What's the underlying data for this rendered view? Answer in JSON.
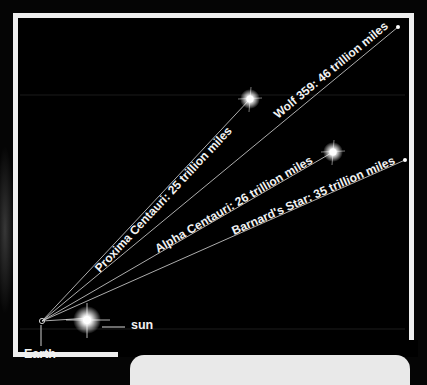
{
  "diagram": {
    "origin_label": "Earth",
    "sun_label": "sun",
    "stars": [
      {
        "name": "Proxima Centauri",
        "distance": "25 trillion miles",
        "label": "Proxima Centauri: 25 trillion miles",
        "type": "bright"
      },
      {
        "name": "Wolf 359",
        "distance": "46 trillion miles",
        "label": "Wolf 359: 46 trillion miles",
        "type": "dot"
      },
      {
        "name": "Alpha Centauri",
        "distance": "26 trillion miles",
        "label": "Alpha Centauri: 26 trillion miles",
        "type": "bright"
      },
      {
        "name": "Barnard's Star",
        "distance": "35 trillion miles",
        "label": "Barnard's Star: 35 trillion miles",
        "type": "dot"
      }
    ]
  },
  "colors": {
    "background": "#000000",
    "frame": "#efefef",
    "line": "#d8d8d8",
    "text": "#f2f2f2"
  }
}
